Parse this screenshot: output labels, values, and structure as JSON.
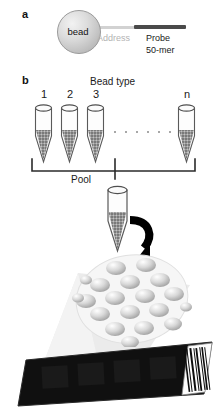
{
  "figure": {
    "panels": [
      {
        "letter": "a",
        "name": "bead-probe-schematic"
      },
      {
        "letter": "b",
        "name": "bead-pooling-schematic"
      }
    ]
  },
  "panel_a": {
    "letter": "a",
    "bead_label": "bead",
    "address_label": "Address",
    "probe_label": "Probe",
    "probe_length_label": "50-mer",
    "colors": {
      "bead_fill": "#cfcfcf",
      "address": "#d2d2d2",
      "probe": "#4a4a4a",
      "address_text": "#b3b3b3"
    }
  },
  "panel_b": {
    "letter": "b",
    "title": "Bead type",
    "tube_labels": [
      "1",
      "2",
      "3",
      "n"
    ],
    "ellipsis_count": 6,
    "pool_label": "Pool",
    "colors": {
      "tube_outline": "#5a5a5a",
      "beads": "#8d8d8d",
      "bracket": "#2b2b2b",
      "arrow": "#000000",
      "array_disc": "#f4f4f4",
      "array_bead": "#b9b9b9",
      "funnel": "#e3e3e3",
      "slide": "#111111",
      "barcode_label": "#ffffff"
    }
  },
  "array": {
    "bead_count": 19,
    "name": "bead-array-disc"
  },
  "slide": {
    "name": "microarray-slide",
    "barcode_bars": 13
  }
}
